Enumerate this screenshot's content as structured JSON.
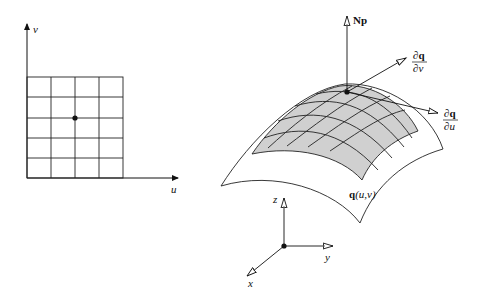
{
  "parameter_domain": {
    "axis_u_label": "u",
    "axis_v_label": "v",
    "grid_columns": 4,
    "grid_rows": 5,
    "grid_bounds": {
      "x0": 27,
      "x1": 123,
      "y0": 77,
      "y1": 178
    },
    "point": {
      "x": 75,
      "y": 118
    }
  },
  "surface": {
    "label": "q(u,v)",
    "label_q": "q",
    "label_args": "(u,v)",
    "patch_fill": "#d0d0d0",
    "line_color": "#222222"
  },
  "vectors": {
    "normal_label": "Np",
    "dqdv": {
      "num": "∂q",
      "den": "∂v"
    },
    "dqdu": {
      "num": "∂q",
      "den": "∂u"
    }
  },
  "world_axes": {
    "x_label": "x",
    "y_label": "y",
    "z_label": "z"
  }
}
